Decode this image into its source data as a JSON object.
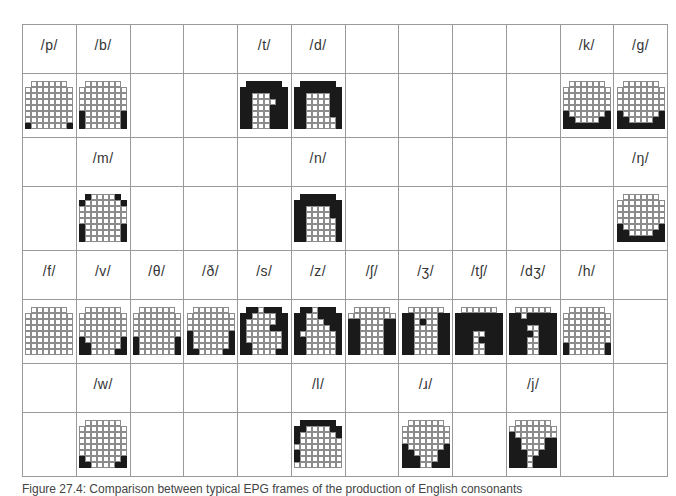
{
  "figure": {
    "columns": 12,
    "rows": [
      {
        "type": "labels",
        "cells": [
          "/p/",
          "/b/",
          "",
          "",
          "/t/",
          "/d/",
          "",
          "",
          "",
          "",
          "/k/",
          "/g/"
        ]
      },
      {
        "type": "palatograms",
        "cells": [
          "p",
          "b",
          "",
          "",
          "t",
          "d",
          "",
          "",
          "",
          "",
          "k",
          "g"
        ]
      },
      {
        "type": "labels",
        "cells": [
          "",
          "/m/",
          "",
          "",
          "",
          "/n/",
          "",
          "",
          "",
          "",
          "",
          "/ŋ/"
        ]
      },
      {
        "type": "palatograms",
        "cells": [
          "",
          "m",
          "",
          "",
          "",
          "n",
          "",
          "",
          "",
          "",
          "",
          "ng"
        ]
      },
      {
        "type": "labels",
        "cells": [
          "/f/",
          "/v/",
          "/θ/",
          "/ð/",
          "/s/",
          "/z/",
          "/ʃ/",
          "/ʒ/",
          "/tʃ/",
          "/dʒ/",
          "/h/",
          ""
        ]
      },
      {
        "type": "palatograms",
        "cells": [
          "f",
          "v",
          "th",
          "dh",
          "s",
          "z",
          "sh",
          "zh",
          "ch",
          "dj",
          "h",
          ""
        ]
      },
      {
        "type": "labels",
        "cells": [
          "",
          "/w/",
          "",
          "",
          "",
          "/l/",
          "",
          "/ɹ/",
          "",
          "/j/",
          "",
          ""
        ]
      },
      {
        "type": "palatograms",
        "cells": [
          "",
          "w",
          "",
          "",
          "",
          "l",
          "",
          "r",
          "",
          "j",
          "",
          ""
        ]
      }
    ]
  },
  "palatograms": {
    "p": [
      " ...... ",
      "........",
      "........",
      "........",
      "........",
      "........",
      "........",
      "#......#"
    ],
    "b": [
      " ...... ",
      "........",
      "........",
      "........",
      "........",
      "#......#",
      "#......#",
      "#......#"
    ],
    "t": [
      " ###### ",
      "########",
      "##...###",
      "##....##",
      "##...###",
      "##...###",
      "##...###",
      "##...###"
    ],
    "d": [
      " ###### ",
      "########",
      "##....##",
      "##....##",
      "##....##",
      "##....##",
      "##.....#",
      "##.....#"
    ],
    "k": [
      " ...... ",
      "........",
      "........",
      "........",
      "........",
      "#......#",
      "##....##",
      "########"
    ],
    "g": [
      " ...... ",
      "........",
      "........",
      "........",
      "........",
      "#......#",
      "##....##",
      "########"
    ],
    "m": [
      " #....# ",
      "#......#",
      "........",
      "........",
      "........",
      "#......#",
      "#......#",
      "#......#"
    ],
    "n": [
      " ###### ",
      "########",
      "##....##",
      "##....##",
      "##.....#",
      "##.....#",
      "##.....#",
      "##.....#"
    ],
    "ng": [
      " ...... ",
      "........",
      "........",
      "........",
      "........",
      "#......#",
      "##....##",
      "########"
    ],
    "f": [
      " ...... ",
      "........",
      "........",
      "........",
      "........",
      "........",
      "........",
      "........"
    ],
    "v": [
      " ...... ",
      "........",
      "........",
      "........",
      "........",
      "#......#",
      "##.....#",
      "##....##"
    ],
    "th": [
      " ...... ",
      "........",
      "........",
      "........",
      "........",
      "#......#",
      "#......#",
      "#......#"
    ],
    "dh": [
      " ...... ",
      "........",
      "........",
      "........",
      "#......#",
      "#......#",
      "#......#",
      "##....##"
    ],
    "s": [
      " ##.### ",
      "##....##",
      "#.....##",
      "#....###",
      "#......#",
      "#......#",
      "##.....#",
      "##....##"
    ],
    "z": [
      " ##.### ",
      "##..####",
      "##...###",
      "##....##",
      "#......#",
      "##.....#",
      "##.....#",
      "##.....#"
    ],
    "sh": [
      " ...... ",
      "........",
      "##....##",
      "##....##",
      "##....##",
      "##....##",
      "##....##",
      "##....##"
    ],
    "zh": [
      " ...... ",
      "##....##",
      "##.#..##",
      "##....##",
      "##....##",
      "##....##",
      "##....##",
      "##....##"
    ],
    "ch": [
      " ...... ",
      "########",
      "########",
      "########",
      "###..###",
      "###.####",
      "###..###",
      "###..###"
    ],
    "dj": [
      " ...... ",
      "##.#####",
      "########",
      "###..###",
      "####.###",
      "###..###",
      "###..###",
      "###..###"
    ],
    "h": [
      " ...... ",
      "........",
      "........",
      "........",
      "........",
      "........",
      "#......#",
      "#......#"
    ],
    "w": [
      " ...... ",
      "........",
      "........",
      "........",
      "........",
      "........",
      "#......#",
      "##....##"
    ],
    "l": [
      " ###### ",
      "##....##",
      "#......#",
      "#.......",
      "........",
      "#.......",
      "#.......",
      "........"
    ],
    "r": [
      " ...... ",
      "........",
      "........",
      "........",
      "#......#",
      "##....##",
      "###...##",
      "###..###"
    ],
    "j": [
      " ...... ",
      "........",
      "#.......",
      "##....##",
      "##....##",
      "###..###",
      "###.####",
      "###.####"
    ]
  },
  "caption": "Figure 27.4: Comparison between typical EPG frames of the production of English consonants"
}
